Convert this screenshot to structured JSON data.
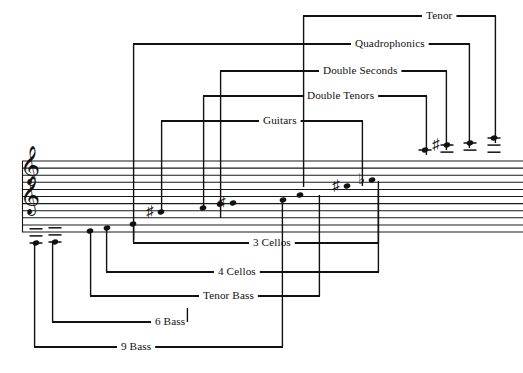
{
  "document": {
    "kind": "music-notation-range-chart",
    "title": "Steelpan orchestra instrument range chart"
  },
  "colors": {
    "ink": "#111111",
    "paper": "#ffffff",
    "staff_line": "#1a1a1a"
  },
  "staff": {
    "clefs": [
      {
        "name": "treble-clef-upper",
        "glyph": "𝄞",
        "x": 30,
        "y": 176
      },
      {
        "name": "treble-clef-lower",
        "glyph": "𝄞",
        "x": 30,
        "y": 206
      }
    ],
    "line_count": 11,
    "top_y": 161,
    "bottom_y": 232,
    "left_x": 22,
    "right_x": 523
  },
  "brackets": [
    {
      "id": "tenor",
      "label": "Tenor",
      "label_x": 426,
      "label_y": 16,
      "rail_y": 16,
      "left_x": 303,
      "right_x": 496,
      "left_drop_y": 187,
      "right_drop_y": 143
    },
    {
      "id": "quadrophonics",
      "label": "Quadrophonics",
      "label_x": 355,
      "label_y": 44,
      "rail_y": 44,
      "left_x": 133,
      "right_x": 470,
      "left_drop_y": 240,
      "right_drop_y": 148
    },
    {
      "id": "double-seconds",
      "label": "Double Seconds",
      "label_x": 323,
      "label_y": 71,
      "rail_y": 71,
      "left_x": 220,
      "right_x": 447,
      "left_drop_y": 218,
      "right_drop_y": 150
    },
    {
      "id": "double-tenors",
      "label": "Double Tenors",
      "label_x": 307,
      "label_y": 96,
      "rail_y": 96,
      "left_x": 203,
      "right_x": 427,
      "left_drop_y": 208,
      "right_drop_y": 155
    },
    {
      "id": "guitars",
      "label": "Guitars",
      "label_x": 263,
      "label_y": 121,
      "rail_y": 121,
      "left_x": 161,
      "right_x": 363,
      "left_drop_y": 212,
      "right_drop_y": 186
    },
    {
      "id": "three-cellos",
      "label": "3 Cellos",
      "label_x": 253,
      "label_y": 243,
      "rail_y": 243,
      "left_x": 133,
      "right_x": 379,
      "left_rise_y": 224,
      "right_rise_y": 181
    },
    {
      "id": "four-cellos",
      "label": "4 Cellos",
      "label_x": 218,
      "label_y": 272,
      "rail_y": 272,
      "left_x": 106,
      "right_x": 379,
      "left_rise_y": 228,
      "right_rise_y": 190
    },
    {
      "id": "tenor-bass",
      "label": "Tenor Bass",
      "label_x": 203,
      "label_y": 296,
      "rail_y": 296,
      "left_x": 90,
      "right_x": 320,
      "left_rise_y": 231,
      "right_rise_y": 195
    },
    {
      "id": "six-bass",
      "label": "6 Bass",
      "label_x": 155,
      "label_y": 322,
      "rail_y": 322,
      "left_x": 52,
      "right_x": 188,
      "left_rise_y": 243,
      "right_rise_y": 308
    },
    {
      "id": "nine-bass",
      "label": "9 Bass",
      "label_x": 121,
      "label_y": 347,
      "rail_y": 347,
      "left_x": 34,
      "right_x": 283,
      "left_rise_y": 243,
      "right_rise_y": 200
    }
  ],
  "notes": [
    {
      "id": "note-9bass-low",
      "x": 36,
      "y": 243,
      "accidental": "",
      "ledgers": 3,
      "ledger_dir": "below"
    },
    {
      "id": "note-6bass-low",
      "x": 55,
      "y": 242,
      "accidental": "",
      "ledgers": 3,
      "ledger_dir": "below"
    },
    {
      "id": "note-tenorbass-low",
      "x": 90,
      "y": 231,
      "accidental": "",
      "ledgers": 0,
      "ledger_dir": "below"
    },
    {
      "id": "note-4cellos-low",
      "x": 107,
      "y": 228,
      "accidental": "",
      "ledgers": 0,
      "ledger_dir": "below"
    },
    {
      "id": "note-3cellos-low",
      "x": 133,
      "y": 224,
      "accidental": "",
      "ledgers": 0,
      "ledger_dir": "below"
    },
    {
      "id": "note-guitars-low",
      "x": 161,
      "y": 212,
      "accidental": "♯",
      "ledgers": 0,
      "ledger_dir": "below"
    },
    {
      "id": "note-dbltenors-low",
      "x": 203,
      "y": 208,
      "accidental": "",
      "ledgers": 0,
      "ledger_dir": "below"
    },
    {
      "id": "note-dblsec-low",
      "x": 220,
      "y": 204,
      "accidental": "",
      "ledgers": 0,
      "ledger_dir": "below"
    },
    {
      "id": "note-quad-low",
      "x": 233,
      "y": 203,
      "accidental": "♯",
      "ledgers": 0,
      "ledger_dir": "below"
    },
    {
      "id": "note-9bass-high",
      "x": 283,
      "y": 200,
      "accidental": "",
      "ledgers": 0,
      "ledger_dir": "above"
    },
    {
      "id": "note-tenorbass-hi",
      "x": 300,
      "y": 195,
      "accidental": "",
      "ledgers": 0,
      "ledger_dir": "above"
    },
    {
      "id": "note-guitars-high",
      "x": 347,
      "y": 186,
      "accidental": "♯",
      "ledgers": 0,
      "ledger_dir": "above"
    },
    {
      "id": "note-tenor-low",
      "x": 372,
      "y": 180,
      "accidental": "♭",
      "ledgers": 0,
      "ledger_dir": "above"
    },
    {
      "id": "note-guitars-top",
      "x": 425,
      "y": 150,
      "accidental": "",
      "ledgers": 1,
      "ledger_dir": "above"
    },
    {
      "id": "note-dbltenors-hi",
      "x": 447,
      "y": 145,
      "accidental": "♯",
      "ledgers": 2,
      "ledger_dir": "above"
    },
    {
      "id": "note-dblsec-high",
      "x": 470,
      "y": 143,
      "accidental": "",
      "ledgers": 2,
      "ledger_dir": "above"
    },
    {
      "id": "note-tenor-high",
      "x": 494,
      "y": 138,
      "accidental": "",
      "ledgers": 3,
      "ledger_dir": "above"
    }
  ]
}
